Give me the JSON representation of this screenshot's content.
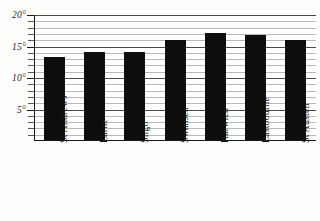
{
  "chart_data": {
    "type": "bar",
    "title": "",
    "subtitle": "",
    "xlabel": "",
    "ylabel": "",
    "categories": [
      "St Andrews",
      "Larne",
      "Sligo",
      "Swansea",
      "Harwich",
      "Eastbourne",
      "St Austell"
    ],
    "values": [
      13.3,
      14.2,
      14.2,
      16.0,
      17.2,
      16.9,
      16.1
    ],
    "ylim": [
      0,
      20
    ],
    "y_major_ticks": [
      5,
      10,
      15,
      20
    ],
    "y_tick_labels": [
      "5°",
      "10°",
      "15°",
      "20°"
    ],
    "y_minor_tick_step": 1,
    "grid": true,
    "grid_orientation": "horizontal",
    "legend": false,
    "bar_color": "#0d0d0d"
  },
  "axes": {
    "y": {
      "ticks": [
        {
          "value": 20,
          "label": "20°"
        },
        {
          "value": 15,
          "label": "15°"
        },
        {
          "value": 10,
          "label": "10°"
        },
        {
          "value": 5,
          "label": "5°"
        }
      ]
    }
  }
}
